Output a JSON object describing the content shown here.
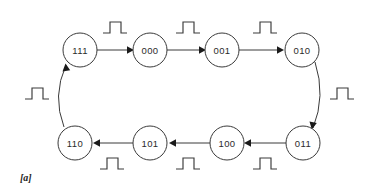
{
  "figure": {
    "caption": "[a]",
    "background_color": "#ffffff",
    "line_color": "#3a3a3a",
    "text_color": "#2b2b2b"
  },
  "diagram": {
    "type": "state-transition-ring",
    "node_radius": 17,
    "nodes": [
      {
        "id": "n111",
        "label": "111",
        "cx": 80,
        "cy": 50,
        "row": "top",
        "order": 0
      },
      {
        "id": "n000",
        "label": "000",
        "cx": 150,
        "cy": 50,
        "row": "top",
        "order": 1
      },
      {
        "id": "n001",
        "label": "001",
        "cx": 222,
        "cy": 50,
        "row": "top",
        "order": 2
      },
      {
        "id": "n010",
        "label": "010",
        "cx": 302,
        "cy": 50,
        "row": "top",
        "order": 3
      },
      {
        "id": "n011",
        "label": "011",
        "cx": 303,
        "cy": 143,
        "row": "bottom",
        "order": 4
      },
      {
        "id": "n100",
        "label": "100",
        "cx": 227,
        "cy": 143,
        "row": "bottom",
        "order": 5
      },
      {
        "id": "n101",
        "label": "101",
        "cx": 150,
        "cy": 143,
        "row": "bottom",
        "order": 6
      },
      {
        "id": "n110",
        "label": "110",
        "cx": 75,
        "cy": 143,
        "row": "bottom",
        "order": 7
      }
    ],
    "edges": [
      {
        "id": "e1",
        "from": "111",
        "to": "000",
        "shape": "straight",
        "direction": "right",
        "label": "clock-pulse"
      },
      {
        "id": "e2",
        "from": "000",
        "to": "001",
        "shape": "straight",
        "direction": "right",
        "label": "clock-pulse"
      },
      {
        "id": "e3",
        "from": "001",
        "to": "010",
        "shape": "straight",
        "direction": "right",
        "label": "clock-pulse"
      },
      {
        "id": "e4",
        "from": "010",
        "to": "011",
        "shape": "arc",
        "direction": "down",
        "label": "clock-pulse"
      },
      {
        "id": "e5",
        "from": "011",
        "to": "100",
        "shape": "straight",
        "direction": "left",
        "label": "clock-pulse"
      },
      {
        "id": "e6",
        "from": "100",
        "to": "101",
        "shape": "straight",
        "direction": "left",
        "label": "clock-pulse"
      },
      {
        "id": "e7",
        "from": "101",
        "to": "110",
        "shape": "straight",
        "direction": "left",
        "label": "clock-pulse"
      },
      {
        "id": "e8",
        "from": "110",
        "to": "111",
        "shape": "arc",
        "direction": "up",
        "label": "clock-pulse"
      }
    ],
    "pulse_symbols": [
      {
        "id": "p1",
        "for_edge": "e1",
        "x": 103,
        "y": 22,
        "position": "above-edge"
      },
      {
        "id": "p2",
        "for_edge": "e2",
        "x": 176,
        "y": 22,
        "position": "above-edge"
      },
      {
        "id": "p3",
        "for_edge": "e3",
        "x": 253,
        "y": 22,
        "position": "above-edge"
      },
      {
        "id": "p4",
        "for_edge": "e4",
        "x": 330,
        "y": 88,
        "position": "right-of-arc"
      },
      {
        "id": "p5",
        "for_edge": "e5",
        "x": 253,
        "y": 158,
        "position": "below-edge"
      },
      {
        "id": "p6",
        "for_edge": "e6",
        "x": 176,
        "y": 158,
        "position": "below-edge"
      },
      {
        "id": "p7",
        "for_edge": "e7",
        "x": 100,
        "y": 158,
        "position": "below-edge"
      },
      {
        "id": "p8",
        "for_edge": "e8",
        "x": 25,
        "y": 88,
        "position": "left-of-arc"
      }
    ],
    "pulse_shape": {
      "name": "clock-pulse-icon",
      "description": "square pulse: low baseline, rising edge, high plateau, falling edge, low baseline",
      "width": 24,
      "height": 11
    },
    "sequence": [
      "111",
      "000",
      "001",
      "010",
      "011",
      "100",
      "101",
      "110"
    ]
  }
}
